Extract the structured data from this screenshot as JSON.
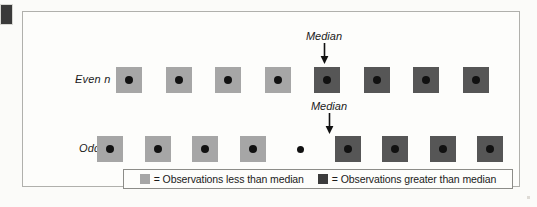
{
  "figure": {
    "name": "median-position-diagram",
    "corner_marker": "dark-square-marker",
    "colors": {
      "less_than_median": "#a6a6a6",
      "greater_than_median": "#565656",
      "legend_swatch_greater": "#3c3c3c",
      "dot": "#111111",
      "panel_border": "#b0b0ac",
      "background": "#fbfbf9"
    }
  },
  "rows": [
    {
      "label": "Even n",
      "median_annotation": {
        "text": "Median",
        "arrow": "down-arrow"
      },
      "observations": [
        {
          "kind": "square",
          "group": "less"
        },
        {
          "kind": "square",
          "group": "less"
        },
        {
          "kind": "square",
          "group": "less"
        },
        {
          "kind": "square",
          "group": "less"
        },
        {
          "kind": "square",
          "group": "greater"
        },
        {
          "kind": "square",
          "group": "greater"
        },
        {
          "kind": "square",
          "group": "greater"
        },
        {
          "kind": "square",
          "group": "greater"
        }
      ]
    },
    {
      "label": "Odd n",
      "median_annotation": {
        "text": "Median",
        "arrow": "down-arrow"
      },
      "observations": [
        {
          "kind": "square",
          "group": "less"
        },
        {
          "kind": "square",
          "group": "less"
        },
        {
          "kind": "square",
          "group": "less"
        },
        {
          "kind": "square",
          "group": "less"
        },
        {
          "kind": "dot",
          "group": "median"
        },
        {
          "kind": "square",
          "group": "greater"
        },
        {
          "kind": "square",
          "group": "greater"
        },
        {
          "kind": "square",
          "group": "greater"
        },
        {
          "kind": "square",
          "group": "greater"
        }
      ]
    }
  ],
  "legend": {
    "equals": "=",
    "entries": [
      {
        "swatch": "less",
        "text": "= Observations less than median"
      },
      {
        "swatch": "greater",
        "text": "= Observations greater than median"
      }
    ]
  }
}
